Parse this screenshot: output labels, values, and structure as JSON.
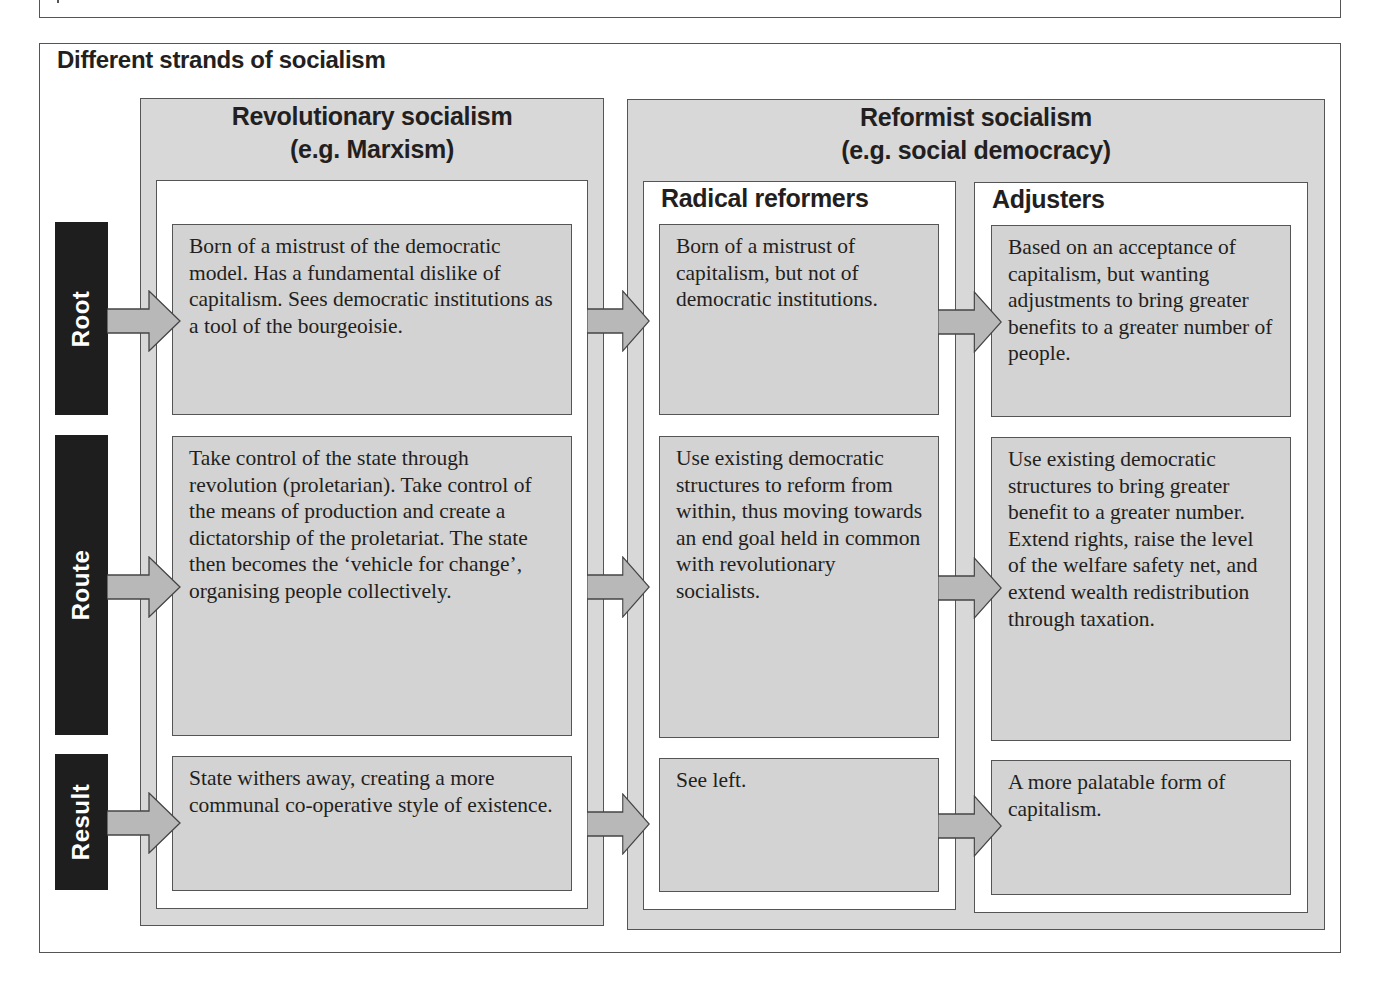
{
  "figure": {
    "title": "Different strands of socialism",
    "row_labels": [
      "Root",
      "Route",
      "Result"
    ],
    "columns": {
      "revolutionary": {
        "title_line1": "Revolutionary socialism",
        "title_line2": "(e.g. Marxism)",
        "cells": [
          "Born of a mistrust of the democratic model. Has a fundamental dislike of capitalism. Sees democratic institutions as a tool of the bourgeoisie.",
          "Take control of the state through revolution (proletarian). Take control of the means of production and create a dictatorship of the proletariat. The state then becomes the ‘vehicle for change’, organising people collectively.",
          "State withers away, creating a more communal co-operative style of existence."
        ]
      },
      "reformist": {
        "title_line1": "Reformist socialism",
        "title_line2": "(e.g. social democracy)",
        "radical": {
          "title": "Radical reformers",
          "cells": [
            "Born of a mistrust of capitalism, but not of democratic institutions.",
            "Use existing democratic structures to reform from within, thus moving towards an end goal held in common with revolutionary socialists.",
            "See left."
          ]
        },
        "adjusters": {
          "title": "Adjusters",
          "cells": [
            "Based on an acceptance of capitalism, but wanting adjustments to bring greater benefits to a greater number of people.",
            "Use existing democratic structures to bring greater benefit to a greater number. Extend rights, raise the level of the welfare safety net, and extend wealth redistribution through taxation.",
            "A more palatable form of capitalism."
          ]
        }
      }
    },
    "colors": {
      "label_bg": "#1e1e1e",
      "panel_gray": "#d8d8d8",
      "cell_gray": "#d3d3d3",
      "arrow_fill": "#b8b8b8",
      "border": "#555555"
    }
  }
}
